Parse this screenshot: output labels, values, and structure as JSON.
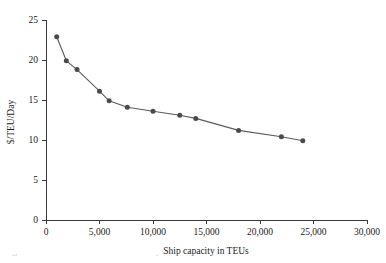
{
  "chart_data": {
    "type": "line",
    "title": "",
    "xlabel": "Ship capacity in TEUs",
    "ylabel": "$/TEU/Day",
    "xlim": [
      0,
      30000
    ],
    "ylim": [
      0,
      25
    ],
    "grid": false,
    "legend": "none",
    "x_ticks": [
      0,
      5000,
      10000,
      15000,
      20000,
      25000,
      30000
    ],
    "x_tick_labels": [
      "0",
      "5,000",
      "10,000",
      "15,000",
      "20,000",
      "25,000",
      "30,000"
    ],
    "y_ticks": [
      0,
      5,
      10,
      15,
      20,
      25
    ],
    "y_tick_labels": [
      "0",
      "5",
      "10",
      "15",
      "20",
      "25"
    ],
    "marker": "filled-circle",
    "marker_color": "#4a4a4a",
    "line_color": "#5a5a5a",
    "x": [
      1000,
      1900,
      2900,
      5000,
      5900,
      7600,
      10000,
      12500,
      14000,
      18000,
      22000,
      24000
    ],
    "y": [
      22.9,
      19.9,
      18.8,
      16.1,
      14.9,
      14.1,
      13.6,
      13.1,
      12.7,
      11.2,
      10.4,
      9.9
    ],
    "points": [
      {
        "x": 1000,
        "y": 22.9
      },
      {
        "x": 1900,
        "y": 19.9
      },
      {
        "x": 2900,
        "y": 18.8
      },
      {
        "x": 5000,
        "y": 16.1
      },
      {
        "x": 5900,
        "y": 14.9
      },
      {
        "x": 7600,
        "y": 14.1
      },
      {
        "x": 10000,
        "y": 13.6
      },
      {
        "x": 12500,
        "y": 13.1
      },
      {
        "x": 14000,
        "y": 12.7
      },
      {
        "x": 18000,
        "y": 11.2
      },
      {
        "x": 22000,
        "y": 10.4
      },
      {
        "x": 24000,
        "y": 9.9
      }
    ]
  },
  "figure": {
    "caption_partial": "Figure  Economies of scale: slot cost by ship capacity"
  }
}
